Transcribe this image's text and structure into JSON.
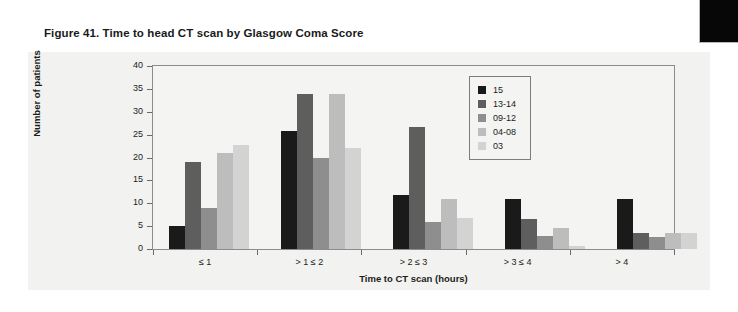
{
  "figure": {
    "title": "Figure 41. Time to head CT scan by Glasgow Coma Score"
  },
  "chart_data": {
    "type": "bar",
    "title": "Figure 41. Time to head CT scan by Glasgow Coma Score",
    "xlabel": "Time to CT scan (hours)",
    "ylabel": "Number of patients",
    "categories": [
      "≤ 1",
      "> 1 ≤ 2",
      "> 2 ≤ 3",
      "> 3 ≤ 4",
      "> 4"
    ],
    "series": [
      {
        "name": "15",
        "color": "#1a1a1a",
        "values": [
          5,
          25.7,
          11.8,
          11,
          11
        ]
      },
      {
        "name": "13-14",
        "color": "#5e5e5e",
        "values": [
          19,
          33.8,
          26.7,
          6.6,
          3.6
        ]
      },
      {
        "name": "09-12",
        "color": "#8e8e8e",
        "values": [
          9,
          19.9,
          5.9,
          2.8,
          2.7
        ]
      },
      {
        "name": "04-08",
        "color": "#bdbdbd",
        "values": [
          21,
          33.8,
          11,
          4.7,
          3.5
        ]
      },
      {
        "name": "03",
        "color": "#d3d3d3",
        "values": [
          22.8,
          22,
          6.8,
          0.6,
          3.5
        ]
      }
    ],
    "ylim": [
      0,
      40
    ],
    "yticks": [
      0,
      5,
      10,
      15,
      20,
      25,
      30,
      35,
      40
    ],
    "grid": false,
    "legend_position": "top-right",
    "legend_entries": [
      "15",
      "13-14",
      "09-12",
      "04-08",
      "03"
    ]
  }
}
